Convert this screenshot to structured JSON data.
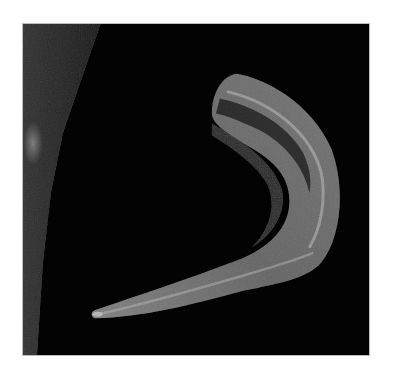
{
  "image": {
    "description": "Grayscale scan of a curved horn-shaped structure on black background",
    "colors": {
      "page_background": "#ffffff",
      "frame_background": "#030303",
      "frame_border": "#bdbdbd",
      "structure_light": "#a8a8a8",
      "structure_mid": "#6a6a6a",
      "structure_dark": "#2a2a2a",
      "side_band": "#2e2e2e"
    }
  }
}
